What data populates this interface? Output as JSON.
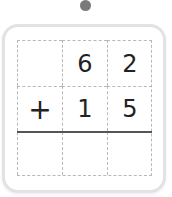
{
  "problem": {
    "operator": "+",
    "rows": [
      [
        "",
        "6",
        "2"
      ],
      [
        "+",
        "1",
        "5"
      ],
      [
        "",
        "",
        ""
      ]
    ]
  },
  "colors": {
    "dot": "#7a7a7a",
    "border": "#e2e2e2",
    "grid_dashed": "#b8b8b8",
    "sum_line": "#555555",
    "digit": "#222222"
  }
}
